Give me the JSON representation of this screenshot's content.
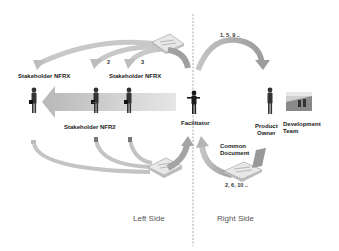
{
  "diagram": {
    "divider": {
      "x": 193,
      "style": "dashed",
      "color": "#aaaaaa"
    },
    "sides": {
      "left": "Left Side",
      "right": "Right Side"
    },
    "stakeholders": [
      {
        "id": "nfrx",
        "label": "Stakeholder NFRX"
      },
      {
        "id": "nfr1",
        "label": "Stakeholder NFR1"
      },
      {
        "id": "nfr2",
        "label": "Stakeholder NFR2"
      }
    ],
    "roles": {
      "facilitator": "Facilitator",
      "product_owner_line1": "Product",
      "product_owner_line2": "Owner",
      "dev_team_line1": "Development",
      "dev_team_line2": "Team"
    },
    "common_document_line1": "Common",
    "common_document_line2": "Document",
    "sequences": {
      "top": "1, 5, 9 ..",
      "bottom": "2, 6, 10 .."
    },
    "arrow_numbers": {
      "top_a": "2",
      "top_b": "3",
      "big_arrow": "..."
    },
    "colors": {
      "arrow_gray": "#a8a8a8",
      "arrow_light": "#d8d8d8",
      "text": "#222222",
      "side_text": "#555555"
    }
  }
}
